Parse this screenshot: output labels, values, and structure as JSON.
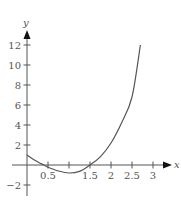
{
  "chart_data": {
    "type": "line",
    "title": "",
    "xlabel": "x",
    "ylabel": "y",
    "xlim": [
      0,
      3.2
    ],
    "ylim": [
      -3,
      13
    ],
    "grid": false,
    "legend": null,
    "x_ticks": [
      0.5,
      1,
      1.5,
      2,
      2.5,
      3
    ],
    "x_tick_labels": [
      "0.5",
      "",
      "1.5",
      "2",
      "2.5",
      "3"
    ],
    "y_ticks": [
      -2,
      2,
      4,
      6,
      8,
      10,
      12
    ],
    "y_tick_labels": [
      "−2",
      "2",
      "4",
      "6",
      "8",
      "10",
      "12"
    ],
    "series": [
      {
        "name": "curve",
        "color": "#555555",
        "x": [
          0,
          0.25,
          0.4,
          0.5,
          0.75,
          1.0,
          1.25,
          1.5,
          1.75,
          2.0,
          2.25,
          2.5,
          2.7
        ],
        "y": [
          1.0,
          0.32,
          0.0,
          -0.22,
          -0.6,
          -0.8,
          -0.64,
          0.0,
          0.84,
          2.2,
          4.2,
          6.8,
          12.0
        ]
      }
    ]
  },
  "axes": {
    "x_label": "x",
    "y_label": "y"
  }
}
